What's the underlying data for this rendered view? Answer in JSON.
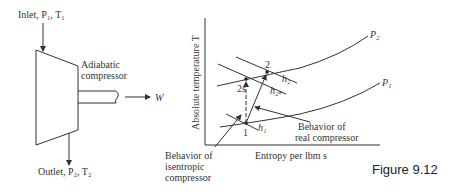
{
  "compressor": {
    "inlet_label": "Inlet, P₁, T₁",
    "outlet_label": "Outlet, P₂, T₂",
    "name_line1": "Adiabatic",
    "name_line2": "compressor",
    "work_label": "W"
  },
  "ts_diagram": {
    "y_axis_label": "Absolute temperature T",
    "x_axis_label": "Entropy per lbm s",
    "curves": [
      {
        "name": "P2",
        "label": "P₂"
      },
      {
        "name": "P1",
        "label": "P₁"
      }
    ],
    "points": [
      {
        "id": "1",
        "label": "1"
      },
      {
        "id": "2",
        "label": "2"
      },
      {
        "id": "2s",
        "label": "2s"
      }
    ],
    "enthalpy_lines": [
      {
        "id": "h1",
        "label": "h₁"
      },
      {
        "id": "h2",
        "label": "h₂"
      },
      {
        "id": "h2s",
        "label": "h₂ₛ"
      }
    ],
    "annotations": {
      "real_line1": "Behavior of",
      "real_line2": "real compressor",
      "isentropic_line1": "Behavior of",
      "isentropic_line2": "isentropic",
      "isentropic_line3": "compressor"
    }
  },
  "figure_caption": "Figure 9.12"
}
